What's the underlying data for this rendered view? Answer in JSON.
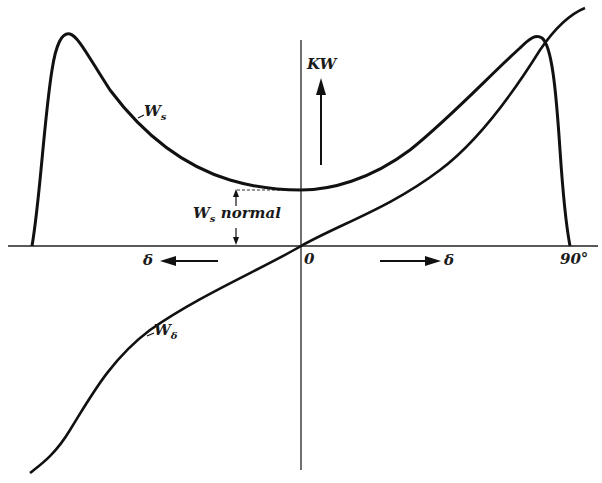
{
  "diagram": {
    "type": "curve-diagram",
    "labels": {
      "y_axis": "KW",
      "origin": "0",
      "right_limit": "90°",
      "delta_left": "δ",
      "delta_right": "δ",
      "ws_main": "W",
      "ws_sub": "s",
      "ws_normal_main": "W",
      "ws_normal_sub": "s",
      "ws_normal_word": "normal",
      "wd_main": "W",
      "wd_sub": "δ"
    },
    "curves": [
      {
        "name": "W_s",
        "description": "synchronizing power; minimum at δ=0 (W_s normal), peaks near ±90° then drops to zero"
      },
      {
        "name": "W_δ",
        "description": "power vs load angle; passes through origin, S-shaped, increasing with δ"
      }
    ],
    "colors": {
      "ink": "#111111",
      "background": "#ffffff"
    }
  }
}
